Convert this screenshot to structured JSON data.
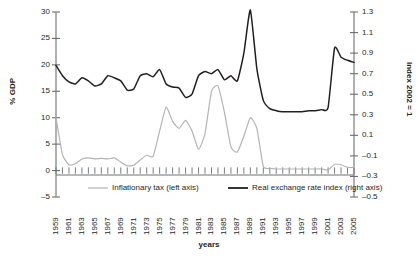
{
  "chart_data": {
    "type": "line",
    "title": "",
    "xlabel": "years",
    "ylabel": "% GDP",
    "y2label": "Index 2002 = 1",
    "grid": false,
    "legend_position": "bottom-center",
    "ylim": [
      -5,
      30
    ],
    "y2lim": [
      -0.5,
      1.3
    ],
    "xlim": [
      1959,
      2005
    ],
    "ytick_labels": [
      "30",
      "25",
      "20",
      "15",
      "10",
      "5",
      "0",
      "-5"
    ],
    "ytick_values": [
      30,
      25,
      20,
      15,
      10,
      5,
      0,
      -5
    ],
    "y2tick_labels": [
      "1.3",
      "1.1",
      "0.9",
      "0.7",
      "0.5",
      "0.3",
      "0.1",
      "-0.1",
      "-0.3",
      "-0.5"
    ],
    "y2tick_values": [
      1.3,
      1.1,
      0.9,
      0.7,
      0.5,
      0.3,
      0.1,
      -0.1,
      -0.3,
      -0.5
    ],
    "xtick_labels": [
      "1959",
      "1961",
      "1963",
      "1965",
      "1967",
      "1969",
      "1971",
      "1973",
      "1975",
      "1977",
      "1979",
      "1981",
      "1983",
      "1985",
      "1987",
      "1989",
      "1991",
      "1993",
      "1995",
      "1997",
      "1999",
      "2001",
      "2003",
      "2005"
    ],
    "xtick_values": [
      1959,
      1961,
      1963,
      1965,
      1967,
      1969,
      1971,
      1973,
      1975,
      1977,
      1979,
      1981,
      1983,
      1985,
      1987,
      1989,
      1991,
      1993,
      1995,
      1997,
      1999,
      2001,
      2003,
      2005
    ],
    "x": [
      1959,
      1960,
      1961,
      1962,
      1963,
      1964,
      1965,
      1966,
      1967,
      1968,
      1969,
      1970,
      1971,
      1972,
      1973,
      1974,
      1975,
      1976,
      1977,
      1978,
      1979,
      1980,
      1981,
      1982,
      1983,
      1984,
      1985,
      1986,
      1987,
      1988,
      1989,
      1990,
      1991,
      1992,
      1993,
      1994,
      1995,
      1996,
      1997,
      1998,
      1999,
      2000,
      2001,
      2002,
      2003,
      2004,
      2005
    ],
    "series": [
      {
        "name": "Inflationary tax (left axis)",
        "axis": "left",
        "color": "#b3b3b3",
        "values": [
          10.0,
          3.0,
          1.1,
          1.3,
          2.2,
          2.4,
          2.2,
          2.3,
          2.2,
          2.4,
          1.6,
          0.9,
          1.0,
          2.0,
          2.9,
          2.7,
          7.5,
          12.0,
          9.3,
          8.0,
          9.5,
          7.5,
          4.0,
          7.0,
          15.0,
          16.0,
          11.0,
          4.5,
          3.5,
          6.5,
          10.0,
          8.0,
          0.8,
          0.4,
          0.3,
          0.3,
          0.3,
          0.3,
          0.3,
          0.3,
          0.3,
          0.3,
          0.1,
          1.2,
          1.1,
          0.6,
          0.6
        ]
      },
      {
        "name": "Real exchange rate index (right axis)",
        "axis": "right",
        "color": "#231f20",
        "values": [
          0.78,
          0.68,
          0.62,
          0.6,
          0.66,
          0.63,
          0.58,
          0.6,
          0.68,
          0.66,
          0.63,
          0.54,
          0.55,
          0.68,
          0.7,
          0.67,
          0.74,
          0.6,
          0.57,
          0.56,
          0.47,
          0.5,
          0.68,
          0.72,
          0.7,
          0.74,
          0.64,
          0.68,
          0.63,
          0.9,
          1.32,
          0.75,
          0.44,
          0.36,
          0.34,
          0.33,
          0.33,
          0.33,
          0.33,
          0.34,
          0.34,
          0.35,
          0.37,
          0.95,
          0.86,
          0.83,
          0.81
        ]
      }
    ],
    "legend": [
      {
        "label": "Inflationary tax (left axis)",
        "color": "#b3b3b3"
      },
      {
        "label": "Real exchange rate index (right axis)",
        "color": "#231f20"
      }
    ]
  }
}
